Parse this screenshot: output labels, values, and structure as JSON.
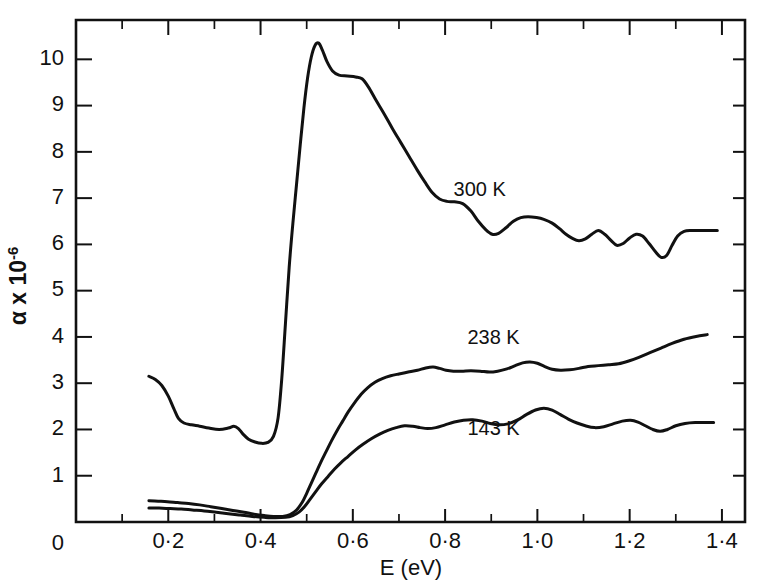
{
  "chart_data": {
    "type": "line",
    "title": "",
    "xlabel": "E (eV)",
    "ylabel": "α x 10⁻⁶",
    "xlim": [
      0.0,
      1.45
    ],
    "ylim": [
      0.0,
      10.85
    ],
    "grid": false,
    "legend_position": "inline-annotations",
    "x_ticks_major": [
      0.2,
      0.4,
      0.6,
      0.8,
      1.0,
      1.2,
      1.4
    ],
    "x_tick_labels": [
      "0·2",
      "0·4",
      "0·6",
      "0·8",
      "1·0",
      "1·2",
      "1·4"
    ],
    "x_ticks_minor": [
      0.1,
      0.3,
      0.5,
      0.7,
      0.9,
      1.1,
      1.3
    ],
    "y_origin_label": "0",
    "y_ticks_major": [
      1,
      2,
      3,
      4,
      5,
      6,
      7,
      8,
      9,
      10
    ],
    "y_tick_labels": [
      "1",
      "2",
      "3",
      "4",
      "5",
      "6",
      "7",
      "8",
      "9",
      "10"
    ],
    "series": [
      {
        "name": "300 K",
        "label": "300 K",
        "label_x": 0.875,
        "label_y": 7.05,
        "points": [
          [
            0.158,
            3.15
          ],
          [
            0.172,
            3.08
          ],
          [
            0.186,
            2.95
          ],
          [
            0.2,
            2.72
          ],
          [
            0.212,
            2.45
          ],
          [
            0.222,
            2.24
          ],
          [
            0.234,
            2.14
          ],
          [
            0.25,
            2.1
          ],
          [
            0.268,
            2.07
          ],
          [
            0.288,
            2.03
          ],
          [
            0.31,
            2.0
          ],
          [
            0.33,
            2.03
          ],
          [
            0.342,
            2.07
          ],
          [
            0.352,
            2.02
          ],
          [
            0.362,
            1.9
          ],
          [
            0.374,
            1.79
          ],
          [
            0.388,
            1.73
          ],
          [
            0.402,
            1.7
          ],
          [
            0.416,
            1.72
          ],
          [
            0.428,
            1.85
          ],
          [
            0.438,
            2.25
          ],
          [
            0.446,
            3.1
          ],
          [
            0.454,
            4.3
          ],
          [
            0.462,
            5.5
          ],
          [
            0.47,
            6.45
          ],
          [
            0.478,
            7.3
          ],
          [
            0.486,
            8.15
          ],
          [
            0.494,
            8.95
          ],
          [
            0.502,
            9.6
          ],
          [
            0.51,
            10.05
          ],
          [
            0.518,
            10.3
          ],
          [
            0.526,
            10.35
          ],
          [
            0.534,
            10.2
          ],
          [
            0.544,
            9.95
          ],
          [
            0.556,
            9.75
          ],
          [
            0.57,
            9.66
          ],
          [
            0.588,
            9.64
          ],
          [
            0.606,
            9.62
          ],
          [
            0.62,
            9.58
          ],
          [
            0.634,
            9.4
          ],
          [
            0.65,
            9.12
          ],
          [
            0.668,
            8.82
          ],
          [
            0.686,
            8.5
          ],
          [
            0.704,
            8.2
          ],
          [
            0.722,
            7.9
          ],
          [
            0.74,
            7.6
          ],
          [
            0.756,
            7.35
          ],
          [
            0.772,
            7.12
          ],
          [
            0.788,
            6.98
          ],
          [
            0.804,
            6.93
          ],
          [
            0.82,
            6.92
          ],
          [
            0.838,
            6.88
          ],
          [
            0.856,
            6.72
          ],
          [
            0.872,
            6.5
          ],
          [
            0.888,
            6.32
          ],
          [
            0.902,
            6.22
          ],
          [
            0.916,
            6.24
          ],
          [
            0.932,
            6.36
          ],
          [
            0.948,
            6.5
          ],
          [
            0.964,
            6.58
          ],
          [
            0.98,
            6.6
          ],
          [
            0.998,
            6.58
          ],
          [
            1.014,
            6.54
          ],
          [
            1.032,
            6.46
          ],
          [
            1.048,
            6.34
          ],
          [
            1.062,
            6.22
          ],
          [
            1.076,
            6.13
          ],
          [
            1.09,
            6.08
          ],
          [
            1.104,
            6.12
          ],
          [
            1.118,
            6.22
          ],
          [
            1.132,
            6.3
          ],
          [
            1.146,
            6.22
          ],
          [
            1.16,
            6.08
          ],
          [
            1.172,
            5.98
          ],
          [
            1.186,
            6.02
          ],
          [
            1.2,
            6.14
          ],
          [
            1.214,
            6.22
          ],
          [
            1.228,
            6.18
          ],
          [
            1.242,
            6.02
          ],
          [
            1.256,
            5.84
          ],
          [
            1.268,
            5.72
          ],
          [
            1.28,
            5.76
          ],
          [
            1.292,
            5.98
          ],
          [
            1.304,
            6.18
          ],
          [
            1.318,
            6.28
          ],
          [
            1.334,
            6.3
          ],
          [
            1.352,
            6.3
          ],
          [
            1.372,
            6.3
          ],
          [
            1.39,
            6.3
          ]
        ]
      },
      {
        "name": "238 K",
        "label": "238 K",
        "label_x": 0.905,
        "label_y": 3.85,
        "points": [
          [
            0.158,
            0.46
          ],
          [
            0.178,
            0.45
          ],
          [
            0.198,
            0.44
          ],
          [
            0.22,
            0.42
          ],
          [
            0.244,
            0.4
          ],
          [
            0.268,
            0.37
          ],
          [
            0.292,
            0.33
          ],
          [
            0.316,
            0.29
          ],
          [
            0.34,
            0.25
          ],
          [
            0.364,
            0.21
          ],
          [
            0.386,
            0.17
          ],
          [
            0.408,
            0.14
          ],
          [
            0.428,
            0.12
          ],
          [
            0.448,
            0.12
          ],
          [
            0.464,
            0.16
          ],
          [
            0.478,
            0.26
          ],
          [
            0.49,
            0.42
          ],
          [
            0.5,
            0.62
          ],
          [
            0.51,
            0.84
          ],
          [
            0.52,
            1.06
          ],
          [
            0.53,
            1.28
          ],
          [
            0.542,
            1.52
          ],
          [
            0.554,
            1.76
          ],
          [
            0.566,
            1.98
          ],
          [
            0.578,
            2.18
          ],
          [
            0.59,
            2.38
          ],
          [
            0.604,
            2.58
          ],
          [
            0.618,
            2.76
          ],
          [
            0.632,
            2.9
          ],
          [
            0.648,
            3.02
          ],
          [
            0.664,
            3.1
          ],
          [
            0.682,
            3.16
          ],
          [
            0.7,
            3.2
          ],
          [
            0.72,
            3.24
          ],
          [
            0.74,
            3.28
          ],
          [
            0.758,
            3.33
          ],
          [
            0.774,
            3.35
          ],
          [
            0.788,
            3.32
          ],
          [
            0.802,
            3.28
          ],
          [
            0.818,
            3.26
          ],
          [
            0.836,
            3.26
          ],
          [
            0.856,
            3.27
          ],
          [
            0.876,
            3.26
          ],
          [
            0.896,
            3.24
          ],
          [
            0.914,
            3.26
          ],
          [
            0.934,
            3.31
          ],
          [
            0.952,
            3.38
          ],
          [
            0.968,
            3.44
          ],
          [
            0.984,
            3.46
          ],
          [
            1.0,
            3.43
          ],
          [
            1.016,
            3.36
          ],
          [
            1.032,
            3.3
          ],
          [
            1.05,
            3.28
          ],
          [
            1.07,
            3.29
          ],
          [
            1.09,
            3.32
          ],
          [
            1.11,
            3.36
          ],
          [
            1.132,
            3.38
          ],
          [
            1.154,
            3.4
          ],
          [
            1.176,
            3.42
          ],
          [
            1.198,
            3.48
          ],
          [
            1.22,
            3.56
          ],
          [
            1.244,
            3.66
          ],
          [
            1.268,
            3.76
          ],
          [
            1.292,
            3.86
          ],
          [
            1.318,
            3.95
          ],
          [
            1.344,
            4.01
          ],
          [
            1.368,
            4.05
          ]
        ]
      },
      {
        "name": "143 K",
        "label": "143 K",
        "label_x": 0.905,
        "label_y": 1.88,
        "points": [
          [
            0.158,
            0.3
          ],
          [
            0.18,
            0.3
          ],
          [
            0.204,
            0.29
          ],
          [
            0.228,
            0.28
          ],
          [
            0.252,
            0.26
          ],
          [
            0.278,
            0.24
          ],
          [
            0.304,
            0.21
          ],
          [
            0.33,
            0.18
          ],
          [
            0.356,
            0.15
          ],
          [
            0.382,
            0.12
          ],
          [
            0.408,
            0.1
          ],
          [
            0.432,
            0.09
          ],
          [
            0.454,
            0.1
          ],
          [
            0.47,
            0.14
          ],
          [
            0.484,
            0.22
          ],
          [
            0.496,
            0.34
          ],
          [
            0.508,
            0.5
          ],
          [
            0.52,
            0.66
          ],
          [
            0.532,
            0.82
          ],
          [
            0.546,
            0.98
          ],
          [
            0.56,
            1.14
          ],
          [
            0.574,
            1.28
          ],
          [
            0.59,
            1.42
          ],
          [
            0.606,
            1.56
          ],
          [
            0.622,
            1.68
          ],
          [
            0.64,
            1.8
          ],
          [
            0.658,
            1.9
          ],
          [
            0.676,
            1.98
          ],
          [
            0.694,
            2.04
          ],
          [
            0.712,
            2.08
          ],
          [
            0.73,
            2.07
          ],
          [
            0.746,
            2.04
          ],
          [
            0.762,
            2.02
          ],
          [
            0.78,
            2.04
          ],
          [
            0.8,
            2.1
          ],
          [
            0.82,
            2.16
          ],
          [
            0.84,
            2.2
          ],
          [
            0.86,
            2.21
          ],
          [
            0.88,
            2.18
          ],
          [
            0.898,
            2.13
          ],
          [
            0.916,
            2.1
          ],
          [
            0.936,
            2.12
          ],
          [
            0.956,
            2.2
          ],
          [
            0.976,
            2.32
          ],
          [
            0.996,
            2.42
          ],
          [
            1.014,
            2.46
          ],
          [
            1.032,
            2.42
          ],
          [
            1.05,
            2.32
          ],
          [
            1.068,
            2.22
          ],
          [
            1.086,
            2.14
          ],
          [
            1.104,
            2.08
          ],
          [
            1.124,
            2.04
          ],
          [
            1.144,
            2.06
          ],
          [
            1.164,
            2.12
          ],
          [
            1.184,
            2.18
          ],
          [
            1.202,
            2.2
          ],
          [
            1.218,
            2.16
          ],
          [
            1.234,
            2.08
          ],
          [
            1.25,
            2.0
          ],
          [
            1.266,
            1.96
          ],
          [
            1.282,
            2.0
          ],
          [
            1.3,
            2.08
          ],
          [
            1.32,
            2.13
          ],
          [
            1.342,
            2.15
          ],
          [
            1.364,
            2.15
          ],
          [
            1.382,
            2.15
          ]
        ]
      }
    ]
  },
  "colors": {
    "ink": "#111111",
    "background": "#ffffff"
  }
}
